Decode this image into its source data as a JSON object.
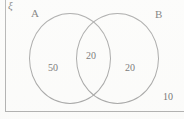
{
  "figure": {
    "type": "venn-diagram",
    "universal_set_symbol": "ξ",
    "sets": [
      {
        "id": "A",
        "label": "A"
      },
      {
        "id": "B",
        "label": "B"
      }
    ],
    "regions": [
      {
        "id": "a-only",
        "label": "A only",
        "value": "50"
      },
      {
        "id": "both",
        "label": "A and B",
        "value": "20"
      },
      {
        "id": "b-only",
        "label": "B only",
        "value": "20"
      },
      {
        "id": "outside",
        "label": "Outside A and B",
        "value": "10"
      }
    ],
    "colors": {
      "background": "#fdfdfc",
      "outline": "#8e8e8e",
      "box_outline": "#9b9b9b",
      "text": "#484848"
    }
  }
}
